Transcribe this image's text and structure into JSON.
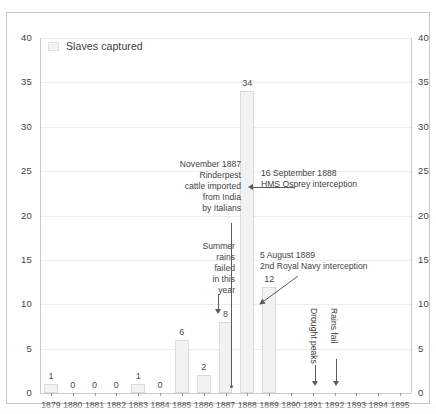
{
  "legend": {
    "swatch_name": "slaves-captured-swatch",
    "label": "Slaves captured"
  },
  "chart_data": {
    "type": "bar",
    "title": "",
    "subtitle": "",
    "xlabel": "",
    "ylabel": "",
    "ylim": [
      0,
      40
    ],
    "ytick_step": 5,
    "grid": true,
    "legend_position": "top-left",
    "dual_y_axis": true,
    "series_name": "Slaves captured",
    "bar_color": "#f2f2f2",
    "bar_border_color": "#dcdcdc",
    "categories": [
      "1879",
      "1880",
      "1881",
      "1882",
      "1883",
      "1884",
      "1885",
      "1886",
      "1887",
      "1888",
      "1889",
      "1890",
      "1891",
      "1892",
      "1893",
      "1894",
      "1895"
    ],
    "values": [
      1,
      0,
      0,
      0,
      1,
      0,
      6,
      2,
      8,
      34,
      12,
      null,
      null,
      null,
      null,
      null,
      null
    ],
    "data_labels": [
      "1",
      "0",
      "0",
      "0",
      "1",
      "0",
      "6",
      "2",
      "8",
      "34",
      "12",
      "",
      "",
      "",
      "",
      "",
      ""
    ],
    "yticks_left": [
      "40",
      "35",
      "30",
      "25",
      "20",
      "15",
      "10",
      "5",
      "0"
    ],
    "yticks_right": [
      "40",
      "35",
      "30",
      "25",
      "20",
      "15",
      "10",
      "5",
      "0"
    ],
    "annotations": [
      {
        "id": "rinderpest",
        "text": "November 1887\nRinderpest\ncattle imported\nfrom India\nby Italians",
        "target_year": "1887",
        "align": "right"
      },
      {
        "id": "hms-osprey",
        "text": "16 September 1888\nHMS Osprey interception",
        "target_year": "1888",
        "align": "left"
      },
      {
        "id": "summer-rains",
        "text": "Summer\nrains\nfailed\nin this\nyear",
        "target_year": "1887",
        "align": "right"
      },
      {
        "id": "royal-navy",
        "text": "5 August 1889\n2nd Royal Navy interception",
        "target_year": "1889",
        "align": "left"
      },
      {
        "id": "drought-peaks",
        "text": "Drought peaks",
        "target_year": "1891",
        "orientation": "vertical"
      },
      {
        "id": "rains-fail",
        "text": "Rains fail",
        "target_year": "1892",
        "orientation": "vertical"
      }
    ]
  },
  "colors": {
    "grid": "#ededed",
    "axis": "#c9c9c9",
    "text": "#3f3f3f",
    "connector": "#5b5b5b"
  }
}
